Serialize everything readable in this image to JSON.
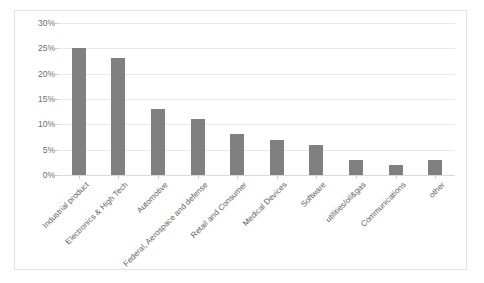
{
  "chart_data": {
    "type": "bar",
    "title": "",
    "xlabel": "",
    "ylabel": "",
    "categories": [
      "Industrial product",
      "Electronics & High Tech",
      "Automotive",
      "Federal, Aerospace and defense",
      "Retail and Consumer",
      "Medical Devices",
      "Software",
      "utilities/oil&gas",
      "Communications",
      "other"
    ],
    "values": [
      25,
      23,
      13,
      11,
      8,
      7,
      6,
      3,
      2,
      3
    ],
    "value_unit": "%",
    "ylim": [
      0,
      30
    ],
    "ytick_values": [
      0,
      5,
      10,
      15,
      20,
      25,
      30
    ],
    "ytick_labels": [
      "0%",
      "5%",
      "10%",
      "15%",
      "20%",
      "25%",
      "30%"
    ],
    "grid": true,
    "legend": false,
    "legend_position": "none",
    "bar_color": "#808080",
    "gridline_color": "#e8e8e8",
    "axis_color": "#d9d9d9",
    "tick_text_color": "#6f6f6f",
    "label_text_color": "#5e5e5e",
    "plot_background": "#ffffff",
    "frame_border_color": "#e3e3e3",
    "x_label_rotation_degrees": -45
  }
}
